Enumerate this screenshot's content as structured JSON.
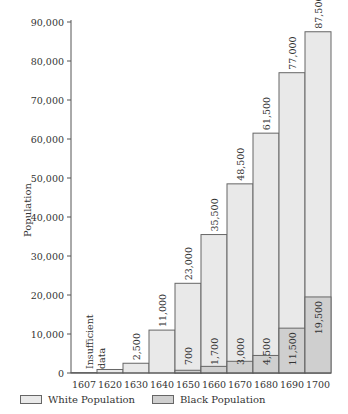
{
  "chart_data": {
    "type": "bar",
    "stacked": true,
    "title": "",
    "xlabel": "",
    "ylabel": "Population",
    "ylim": [
      0,
      90000
    ],
    "yticks": [
      0,
      10000,
      20000,
      30000,
      40000,
      50000,
      60000,
      70000,
      80000,
      90000
    ],
    "ytick_labels": [
      "0",
      "10,000",
      "20,000",
      "30,000",
      "40,000",
      "50,000",
      "60,000",
      "70,000",
      "80,000",
      "90,000"
    ],
    "categories": [
      "1607",
      "1620",
      "1630",
      "1640",
      "1650",
      "1660",
      "1670",
      "1680",
      "1690",
      "1700"
    ],
    "series": [
      {
        "name": "White Population",
        "color": "#e9e9e9",
        "values": [
          100,
          900,
          2500,
          11000,
          23000,
          35500,
          48500,
          61500,
          77000,
          87500
        ],
        "labels": [
          "",
          "",
          "2,500",
          "11,000",
          "23,000",
          "35,500",
          "48,500",
          "61,500",
          "77,000",
          "87,500"
        ]
      },
      {
        "name": "Black Population",
        "color": "#cfcfcf",
        "values": [
          0,
          0,
          0,
          0,
          700,
          1700,
          3000,
          4500,
          11500,
          19500
        ],
        "labels": [
          "",
          "",
          "",
          "",
          "700",
          "1,700",
          "3,000",
          "4,500",
          "11,500",
          "19,500"
        ]
      }
    ],
    "annotations": [
      {
        "category": "1607-1620",
        "text": [
          "Insufficient",
          "data"
        ]
      }
    ],
    "grid": false,
    "legend_position": "bottom"
  },
  "legend": {
    "white_label": "White Population",
    "black_label": "Black Population"
  },
  "axis": {
    "ylabel": "Population"
  },
  "annotation": {
    "line1": "Insufficient",
    "line2": "data"
  }
}
